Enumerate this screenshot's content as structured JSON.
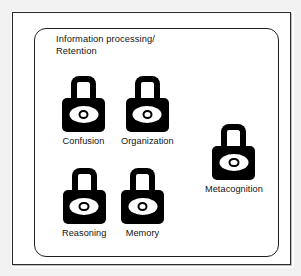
{
  "figure": {
    "title_line_1": "Information processing/",
    "title_line_2": "Retention",
    "title": "Information processing/\nRetention",
    "colors": {
      "ink": "#131313",
      "icon_fill": "#000000",
      "icon_keyhole": "#ffffff",
      "frame": "#2b2b2b",
      "page": "#ffffff"
    },
    "nodes": [
      {
        "id": "confusion",
        "label": "Confusion",
        "icon": "padlock-icon",
        "row": 1,
        "column": 1
      },
      {
        "id": "organization",
        "label": "Organization",
        "icon": "padlock-icon",
        "row": 1,
        "column": 2
      },
      {
        "id": "reasoning",
        "label": "Reasoning",
        "icon": "padlock-icon",
        "row": 2,
        "column": 1
      },
      {
        "id": "memory",
        "label": "Memory",
        "icon": "padlock-icon",
        "row": 2,
        "column": 2
      },
      {
        "id": "metacognition",
        "label": "Metacognition",
        "icon": "padlock-icon",
        "row": 1,
        "column": 3
      }
    ]
  }
}
